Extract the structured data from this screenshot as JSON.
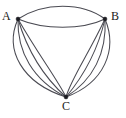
{
  "figure": {
    "kind": "graph-diagram",
    "width": 126,
    "height": 118,
    "background_color": "#ffffff",
    "edge_color": "#4a4a52",
    "vertex_color": "#1c1c22",
    "label_color": "#1b1b20"
  },
  "vertices": [
    {
      "id": "A",
      "label": "A",
      "x": 18,
      "y": 19,
      "label_x": 2,
      "label_y": 10
    },
    {
      "id": "B",
      "label": "B",
      "x": 105,
      "y": 19,
      "label_x": 111,
      "label_y": 10
    },
    {
      "id": "C",
      "label": "C",
      "x": 66,
      "y": 97,
      "label_x": 62,
      "label_y": 100
    }
  ],
  "edges": [
    {
      "id": "AB-1",
      "from": "A",
      "to": "B",
      "path": "M18,19 C44,2 82,2 105,19"
    },
    {
      "id": "AB-2",
      "from": "A",
      "to": "B",
      "path": "M18,19 C44,30 82,30 105,19"
    },
    {
      "id": "AC-1",
      "from": "A",
      "to": "C",
      "path": "M18,19 C4,50 22,83 66,97"
    },
    {
      "id": "AC-2",
      "from": "A",
      "to": "C",
      "path": "M18,19 C17,52 33,80 66,97"
    },
    {
      "id": "AC-3",
      "from": "A",
      "to": "C",
      "path": "M18,19 C28,53 46,79 66,97"
    },
    {
      "id": "AC-4",
      "from": "A",
      "to": "C",
      "path": "M18,19 C38,54 57,79 66,97"
    },
    {
      "id": "BC-1",
      "from": "B",
      "to": "C",
      "path": "M105,19 C118,50 104,83 66,97"
    },
    {
      "id": "BC-2",
      "from": "B",
      "to": "C",
      "path": "M105,19 C107,53 93,80 66,97"
    },
    {
      "id": "BC-3",
      "from": "B",
      "to": "C",
      "path": "M105,19 C97,54 81,79 66,97"
    },
    {
      "id": "BC-4",
      "from": "B",
      "to": "C",
      "path": "M105,19 C88,55 71,79 66,97"
    }
  ],
  "counts": {
    "AB": 2,
    "AC": 4,
    "BC": 4,
    "total_edges": 10,
    "total_vertices": 3
  }
}
